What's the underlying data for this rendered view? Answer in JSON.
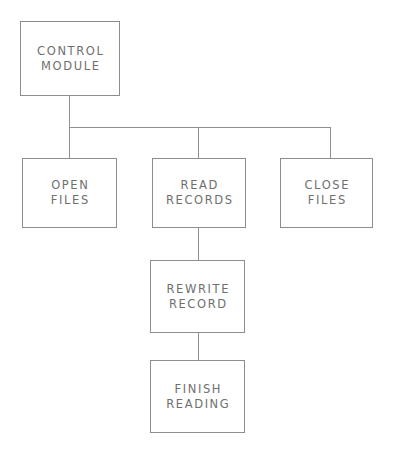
{
  "diagram": {
    "type": "structure-chart",
    "background_color": "#ffffff",
    "line_color": "#8d8d8d",
    "text_color": "#6f6f6f",
    "nodes": [
      {
        "id": "control-module",
        "lines": [
          "CONTROL",
          "MODULE"
        ],
        "x": 20,
        "y": 21,
        "w": 100,
        "h": 75
      },
      {
        "id": "open-files",
        "lines": [
          "OPEN",
          "FILES"
        ],
        "x": 22,
        "y": 158,
        "w": 95,
        "h": 70
      },
      {
        "id": "read-records",
        "lines": [
          "READ",
          "RECORDS"
        ],
        "x": 152,
        "y": 158,
        "w": 94,
        "h": 70
      },
      {
        "id": "close-files",
        "lines": [
          "CLOSE",
          "FILES"
        ],
        "x": 280,
        "y": 158,
        "w": 93,
        "h": 70
      },
      {
        "id": "rewrite-record",
        "lines": [
          "REWRITE",
          "RECORD"
        ],
        "x": 150,
        "y": 260,
        "w": 95,
        "h": 73
      },
      {
        "id": "finish-reading",
        "lines": [
          "FINISH",
          "READING"
        ],
        "x": 150,
        "y": 360,
        "w": 95,
        "h": 73
      }
    ],
    "connectors": [
      {
        "id": "control-module-drop",
        "orientation": "vertical",
        "x": 69,
        "y": 96,
        "length": 31
      },
      {
        "id": "sibling-bus",
        "orientation": "horizontal",
        "x": 69,
        "y": 127,
        "length": 262
      },
      {
        "id": "open-files-drop",
        "orientation": "vertical",
        "x": 69,
        "y": 127,
        "length": 31
      },
      {
        "id": "read-records-drop",
        "orientation": "vertical",
        "x": 198,
        "y": 127,
        "length": 31
      },
      {
        "id": "close-files-drop",
        "orientation": "vertical",
        "x": 330,
        "y": 127,
        "length": 31
      },
      {
        "id": "rewrite-record-link",
        "orientation": "vertical",
        "x": 198,
        "y": 228,
        "length": 32
      },
      {
        "id": "finish-reading-link",
        "orientation": "vertical",
        "x": 198,
        "y": 333,
        "length": 27
      }
    ]
  }
}
